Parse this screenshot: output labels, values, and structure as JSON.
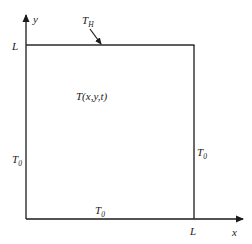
{
  "diagram": {
    "type": "square heat-conduction domain with boundary conditions",
    "axes": {
      "x_label": "x",
      "y_label": "y"
    },
    "tick_labels": {
      "x_end": "L",
      "y_end": "L"
    },
    "domain_label": "T(x,y,t)",
    "boundaries": {
      "top": {
        "symbol": "T",
        "subscript": "H"
      },
      "left": {
        "symbol": "T",
        "subscript": "0"
      },
      "right": {
        "symbol": "T",
        "subscript": "0"
      },
      "bottom": {
        "symbol": "T",
        "subscript": "0"
      }
    },
    "colors": {
      "line": "#1a1a1a",
      "background": "#ffffff"
    }
  }
}
